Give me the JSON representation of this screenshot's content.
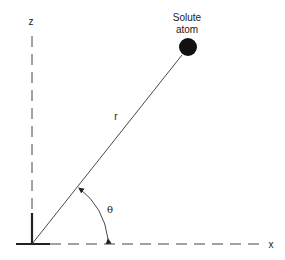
{
  "diagram": {
    "type": "geometry",
    "labels": {
      "z_axis": "z",
      "x_axis": "x",
      "solute_line1": "Solute",
      "solute_line2": "atom",
      "radius": "r",
      "angle": "θ"
    },
    "colors": {
      "line": "#333333",
      "atom": "#111111",
      "background": "#ffffff"
    }
  }
}
